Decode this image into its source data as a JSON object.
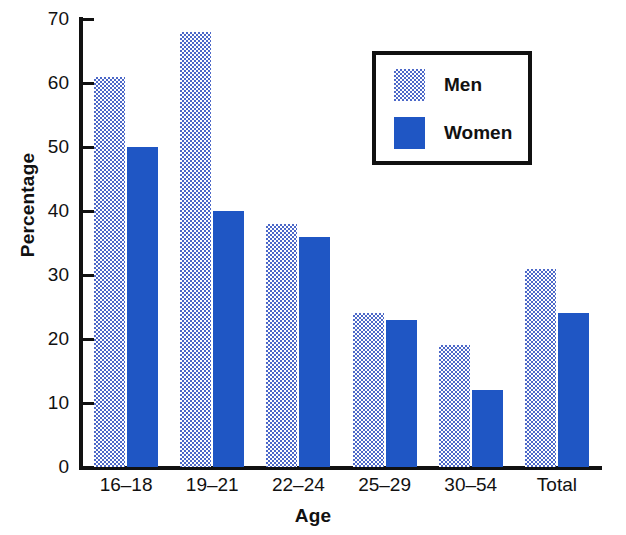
{
  "chart_data": {
    "type": "bar",
    "title": "",
    "xlabel": "Age",
    "ylabel": "Percentage",
    "categories": [
      "16–18",
      "19–21",
      "22–24",
      "25–29",
      "30–54",
      "Total"
    ],
    "series": [
      {
        "name": "Men",
        "values": [
          61,
          68,
          38,
          24,
          19,
          31
        ],
        "color": "#4c68c8",
        "fill": "dotted-checker"
      },
      {
        "name": "Women",
        "values": [
          50,
          40,
          36,
          23,
          12,
          24
        ],
        "color": "#1f56c4",
        "fill": "solid"
      }
    ],
    "ylim": [
      0,
      70
    ],
    "ytick_values": [
      0,
      10,
      20,
      30,
      40,
      50,
      60,
      70
    ],
    "ytick_labels": [
      "0",
      "10",
      "20",
      "30",
      "40",
      "50",
      "60",
      "70"
    ],
    "grid": false,
    "legend_position": "upper-right-inset",
    "legend_entries": [
      "Men",
      "Women"
    ],
    "axis_color": "#111111",
    "background": "#ffffff"
  }
}
